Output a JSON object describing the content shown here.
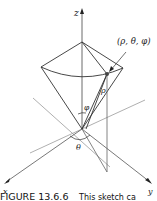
{
  "figure": {
    "axes": {
      "x": "x",
      "y": "y",
      "z": "z"
    },
    "point_label": "(ρ, θ, φ)",
    "rho_label": "ρ",
    "phi_label": "φ",
    "theta_label": "θ",
    "caption_number": "FIGURE 13.6.6",
    "caption_text": "This sketch ca"
  }
}
